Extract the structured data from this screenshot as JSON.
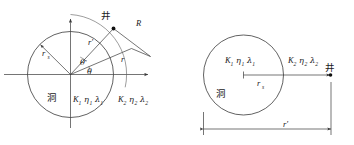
{
  "figure": {
    "background_color": "#ffffff",
    "line_color": "#3a3a3a",
    "text_color": "#1a1a1a"
  },
  "left_diagram": {
    "name": "polar-coordinate-well-cavity",
    "well_label": "井",
    "cavity_label": "洞",
    "radius_label": "r",
    "radius_subscript": "s",
    "source_radius_label": "r′",
    "field_radius_label": "r",
    "distance_label": "R",
    "angle_primary": "θ",
    "angle_secondary": "θ′",
    "inner_medium": {
      "k": "K",
      "k_sub": "1",
      "eta": "η",
      "eta_sub": "1",
      "lambda": "λ",
      "lambda_sub": "1"
    },
    "outer_medium": {
      "k": "K",
      "k_sub": "2",
      "eta": "η",
      "eta_sub": "2",
      "lambda": "λ",
      "lambda_sub": "2"
    }
  },
  "right_diagram": {
    "name": "linear-well-cavity",
    "well_label": "井",
    "cavity_label": "洞",
    "radius_label": "r",
    "radius_subscript": "s",
    "distance_label": "r′",
    "inner_medium": {
      "k": "K",
      "k_sub": "1",
      "eta": "η",
      "eta_sub": "1",
      "lambda": "λ",
      "lambda_sub": "1"
    },
    "outer_medium": {
      "k": "K",
      "k_sub": "2",
      "eta": "η",
      "eta_sub": "2",
      "lambda": "λ",
      "lambda_sub": "2"
    }
  }
}
